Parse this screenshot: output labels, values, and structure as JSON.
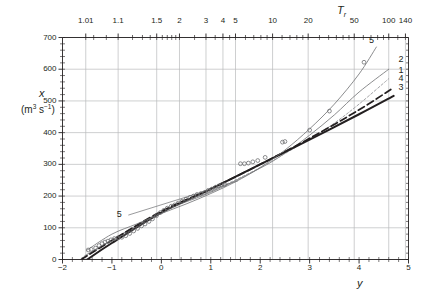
{
  "chart_data": {
    "type": "line",
    "title": "",
    "xlabel": "y",
    "ylabel": "x",
    "ylabel_units": "(m3 s-1)",
    "top_xlabel": "Tr",
    "xlim": [
      -2,
      5
    ],
    "ylim": [
      0,
      700
    ],
    "grid": true,
    "legend": "inline-curve-numbers",
    "x_ticks": [
      "-2",
      "-1",
      "0",
      "1",
      "2",
      "3",
      "4",
      "5"
    ],
    "x_tick_values": [
      -2,
      -1,
      0,
      1,
      2,
      3,
      4,
      5
    ],
    "y_ticks": [
      "0",
      "100",
      "200",
      "300",
      "400",
      "500",
      "600",
      "700"
    ],
    "y_tick_values": [
      0,
      100,
      200,
      300,
      400,
      500,
      600,
      700
    ],
    "top_ticks": [
      "1.01",
      "1.1",
      "1.5",
      "2",
      "3",
      "4",
      "5",
      "10",
      "20",
      "50",
      "100",
      "140"
    ],
    "top_tick_values": [
      1.01,
      1.1,
      1.5,
      2,
      3,
      4,
      5,
      10,
      20,
      50,
      100,
      140
    ],
    "top_minor_tick_values": [
      1.02,
      1.05,
      1.2,
      1.3,
      1.4,
      1.6,
      1.7,
      1.8,
      1.9,
      2.5,
      3.5,
      4.5,
      6,
      7,
      8,
      9,
      12,
      14,
      16,
      18,
      25,
      30,
      35,
      40,
      45,
      60,
      70,
      80,
      90,
      120
    ],
    "series": [
      {
        "name": "1",
        "label": "1",
        "style": "solid-thin",
        "color": "#6d6e71",
        "label_pos": {
          "y": 4.85,
          "x": 595
        },
        "points": [
          {
            "y": -1.55,
            "x": 12
          },
          {
            "y": -1.0,
            "x": 62
          },
          {
            "y": 0.0,
            "x": 150
          },
          {
            "y": 1.0,
            "x": 212
          },
          {
            "y": 2.0,
            "x": 288
          },
          {
            "y": 2.5,
            "x": 335
          },
          {
            "y": 3.0,
            "x": 392
          },
          {
            "y": 3.5,
            "x": 456
          },
          {
            "y": 4.0,
            "x": 528
          },
          {
            "y": 4.6,
            "x": 600
          }
        ]
      },
      {
        "name": "2",
        "label": "2",
        "style": "dotted-fine",
        "color": "#9a9b9e",
        "label_pos": {
          "y": 4.85,
          "x": 628
        },
        "points": [
          {
            "y": -1.6,
            "x": 5
          },
          {
            "y": -1.0,
            "x": 60
          },
          {
            "y": 0.0,
            "x": 150
          },
          {
            "y": 1.0,
            "x": 215
          },
          {
            "y": 2.0,
            "x": 290
          },
          {
            "y": 3.0,
            "x": 380
          },
          {
            "y": 3.5,
            "x": 430
          },
          {
            "y": 4.0,
            "x": 490
          },
          {
            "y": 4.6,
            "x": 570
          }
        ]
      },
      {
        "name": "3",
        "label": "3",
        "style": "solid-thick",
        "color": "#231f20",
        "label_pos": {
          "y": 4.85,
          "x": 540
        },
        "points": [
          {
            "y": -1.5,
            "x": 0
          },
          {
            "y": -1.0,
            "x": 52
          },
          {
            "y": 0.0,
            "x": 148
          },
          {
            "y": 1.0,
            "x": 222
          },
          {
            "y": 2.0,
            "x": 300
          },
          {
            "y": 3.0,
            "x": 378
          },
          {
            "y": 4.0,
            "x": 458
          },
          {
            "y": 4.7,
            "x": 516
          }
        ]
      },
      {
        "name": "4",
        "label": "4",
        "style": "dashed-thick",
        "color": "#231f20",
        "label_pos": {
          "y": 4.85,
          "x": 570
        },
        "points": [
          {
            "y": -1.62,
            "x": 0
          },
          {
            "y": -1.0,
            "x": 60
          },
          {
            "y": 0.0,
            "x": 152
          },
          {
            "y": 1.0,
            "x": 223
          },
          {
            "y": 2.0,
            "x": 300
          },
          {
            "y": 3.0,
            "x": 382
          },
          {
            "y": 4.0,
            "x": 472
          },
          {
            "y": 4.7,
            "x": 542
          }
        ]
      },
      {
        "name": "5",
        "label": "5",
        "style": "solid-thin",
        "color": "#6d6e71",
        "label_pos": {
          "y": 4.25,
          "x": 690
        },
        "label_pos_left": {
          "y": -0.85,
          "x": 140
        },
        "points": [
          {
            "y": -1.5,
            "x": 30
          },
          {
            "y": -1.0,
            "x": 80
          },
          {
            "y": -0.5,
            "x": 112
          },
          {
            "y": 0.0,
            "x": 145
          },
          {
            "y": 0.5,
            "x": 175
          },
          {
            "y": 1.0,
            "x": 208
          },
          {
            "y": 1.5,
            "x": 245
          },
          {
            "y": 2.0,
            "x": 290
          },
          {
            "y": 2.5,
            "x": 345
          },
          {
            "y": 3.0,
            "x": 412
          },
          {
            "y": 3.5,
            "x": 490
          },
          {
            "y": 4.0,
            "x": 585
          },
          {
            "y": 4.35,
            "x": 670
          }
        ]
      }
    ],
    "observations": {
      "name": "observed data",
      "marker": "open-circle",
      "color": "#6d6e71",
      "points": [
        {
          "y": -1.48,
          "x": 30
        },
        {
          "y": -1.42,
          "x": 32
        },
        {
          "y": -1.33,
          "x": 36
        },
        {
          "y": -1.26,
          "x": 44
        },
        {
          "y": -1.2,
          "x": 50
        },
        {
          "y": -1.14,
          "x": 55
        },
        {
          "y": -1.08,
          "x": 58
        },
        {
          "y": -1.02,
          "x": 62
        },
        {
          "y": -0.95,
          "x": 66
        },
        {
          "y": -0.88,
          "x": 68
        },
        {
          "y": -0.8,
          "x": 70
        },
        {
          "y": -0.72,
          "x": 75
        },
        {
          "y": -0.64,
          "x": 82
        },
        {
          "y": -0.56,
          "x": 90
        },
        {
          "y": -0.48,
          "x": 98
        },
        {
          "y": -0.4,
          "x": 106
        },
        {
          "y": -0.33,
          "x": 112
        },
        {
          "y": -0.25,
          "x": 120
        },
        {
          "y": -0.18,
          "x": 128
        },
        {
          "y": -0.1,
          "x": 138
        },
        {
          "y": -0.02,
          "x": 148
        },
        {
          "y": 0.05,
          "x": 155
        },
        {
          "y": 0.12,
          "x": 162
        },
        {
          "y": 0.2,
          "x": 168
        },
        {
          "y": 0.27,
          "x": 172
        },
        {
          "y": 0.34,
          "x": 178
        },
        {
          "y": 0.42,
          "x": 184
        },
        {
          "y": 0.5,
          "x": 190
        },
        {
          "y": 0.58,
          "x": 196
        },
        {
          "y": 0.65,
          "x": 200
        },
        {
          "y": 0.72,
          "x": 205
        },
        {
          "y": 0.8,
          "x": 208
        },
        {
          "y": 0.88,
          "x": 212
        },
        {
          "y": 0.95,
          "x": 218
        },
        {
          "y": 1.02,
          "x": 222
        },
        {
          "y": 1.1,
          "x": 228
        },
        {
          "y": 1.16,
          "x": 232
        },
        {
          "y": 1.22,
          "x": 236
        },
        {
          "y": 1.28,
          "x": 236
        },
        {
          "y": 1.6,
          "x": 302
        },
        {
          "y": 1.68,
          "x": 302
        },
        {
          "y": 1.76,
          "x": 304
        },
        {
          "y": 1.85,
          "x": 308
        },
        {
          "y": 1.95,
          "x": 312
        },
        {
          "y": 2.1,
          "x": 322
        },
        {
          "y": 2.45,
          "x": 370
        },
        {
          "y": 2.5,
          "x": 372
        },
        {
          "y": 3.0,
          "x": 408
        },
        {
          "y": 3.4,
          "x": 468
        },
        {
          "y": 4.1,
          "x": 622
        }
      ]
    }
  },
  "axes": {
    "y_axis_label": "x",
    "y_axis_units_prefix": "(m",
    "y_axis_units_sup1": "3",
    "y_axis_units_mid": " s",
    "y_axis_units_sup2": "−1",
    "y_axis_units_suffix": ")",
    "x_axis_label": "y",
    "top_axis_label": "T",
    "top_axis_label_sub": "r"
  }
}
